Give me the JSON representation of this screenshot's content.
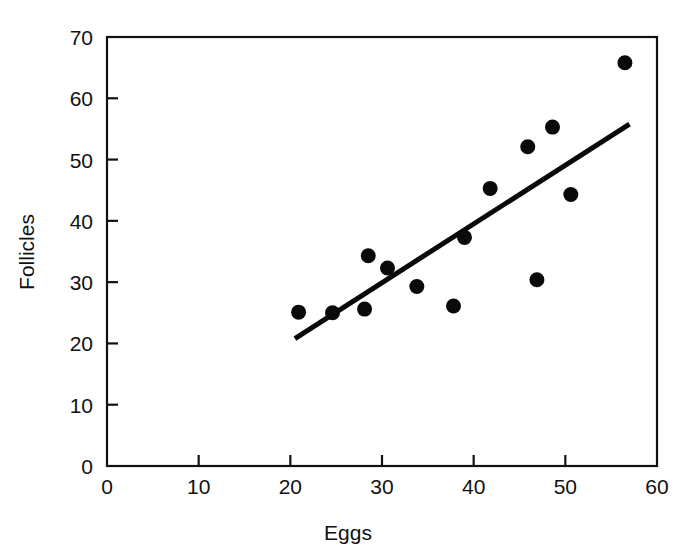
{
  "figure": {
    "background_color": "#ffffff",
    "ink_color": "#0a0a0a"
  },
  "chart_data": {
    "type": "scatter",
    "title": "",
    "xlabel": "Eggs",
    "ylabel": "Follicles",
    "xlim": [
      0,
      60
    ],
    "ylim": [
      0,
      70
    ],
    "xticks": [
      0,
      10,
      20,
      30,
      40,
      50,
      60
    ],
    "yticks": [
      0,
      10,
      20,
      30,
      40,
      50,
      60,
      70
    ],
    "xtick_labels": [
      "0",
      "10",
      "20",
      "30",
      "40",
      "50",
      "60"
    ],
    "ytick_labels": [
      "0",
      "10",
      "20",
      "30",
      "40",
      "50",
      "60",
      "70"
    ],
    "grid": false,
    "legend": null,
    "frame": "box",
    "marker": "filled-circle",
    "marker_size_px": 15,
    "points": [
      {
        "x": 20.9,
        "y": 25.1
      },
      {
        "x": 24.6,
        "y": 25.0
      },
      {
        "x": 28.1,
        "y": 25.6
      },
      {
        "x": 28.5,
        "y": 34.3
      },
      {
        "x": 30.6,
        "y": 32.3
      },
      {
        "x": 33.8,
        "y": 29.3
      },
      {
        "x": 37.8,
        "y": 26.1
      },
      {
        "x": 39.0,
        "y": 37.3
      },
      {
        "x": 41.8,
        "y": 45.3
      },
      {
        "x": 45.9,
        "y": 52.1
      },
      {
        "x": 46.9,
        "y": 30.4
      },
      {
        "x": 48.6,
        "y": 55.3
      },
      {
        "x": 50.6,
        "y": 44.3
      },
      {
        "x": 56.5,
        "y": 65.8
      }
    ],
    "trend_line": {
      "type": "linear-fit",
      "x_start": 20.5,
      "y_start": 20.8,
      "x_end": 57.0,
      "y_end": 55.8
    }
  }
}
